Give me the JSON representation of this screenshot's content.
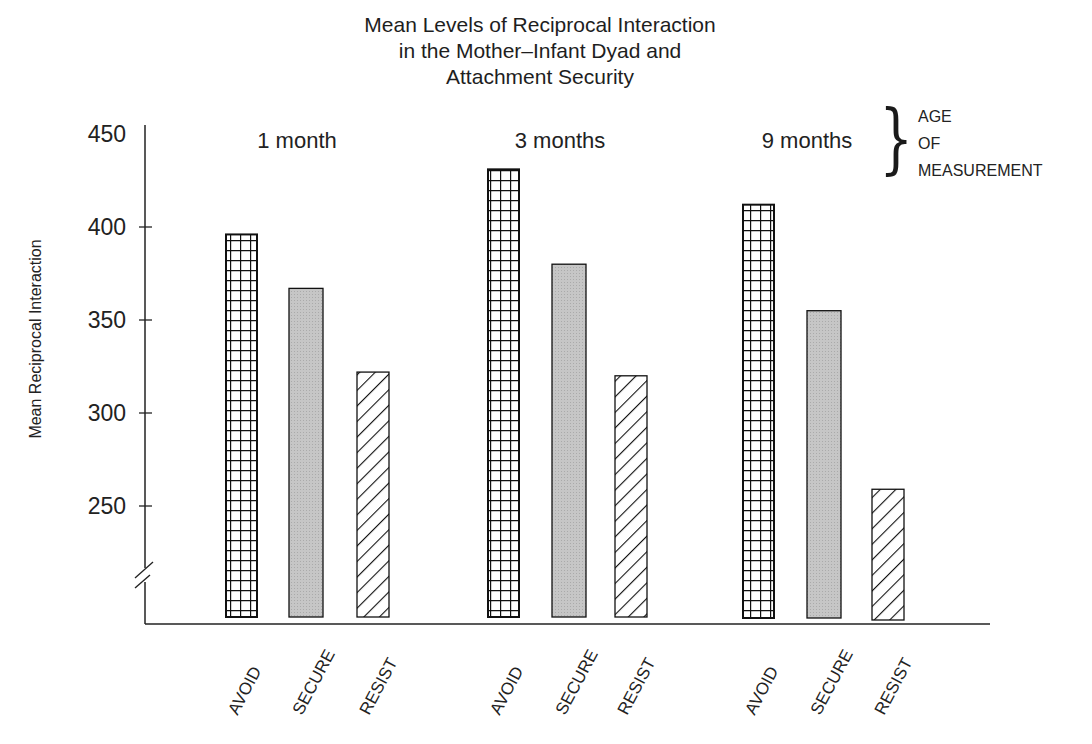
{
  "chart_data": {
    "type": "bar",
    "title": "Mean Levels of Reciprocal Interaction in the Mother–Infant Dyad and Attachment Security",
    "title_lines": [
      "Mean Levels of Reciprocal Interaction",
      "in the Mother–Infant Dyad and",
      "Attachment Security"
    ],
    "xlabel": "",
    "ylabel": "Mean Reciprocal Interaction",
    "ylim": [
      200,
      450
    ],
    "yticks": [
      250,
      300,
      350,
      400,
      450
    ],
    "axis_break": true,
    "grid": false,
    "legend": null,
    "group_annotation": [
      "AGE",
      "OF",
      "MEASUREMENT"
    ],
    "groups": [
      "1 month",
      "3 months",
      "9 months"
    ],
    "categories": [
      "AVOID",
      "SECURE",
      "RESIST"
    ],
    "series": [
      {
        "name": "AVOID",
        "pattern": "grid",
        "values": [
          396,
          431,
          412
        ]
      },
      {
        "name": "SECURE",
        "pattern": "gray",
        "values": [
          367,
          380,
          355
        ]
      },
      {
        "name": "RESIST",
        "pattern": "hatch",
        "values": [
          322,
          320,
          259
        ]
      }
    ]
  },
  "colors": {
    "ink": "#1a1a1a",
    "secure_fill": "#c4c4c4",
    "background": "#ffffff"
  }
}
